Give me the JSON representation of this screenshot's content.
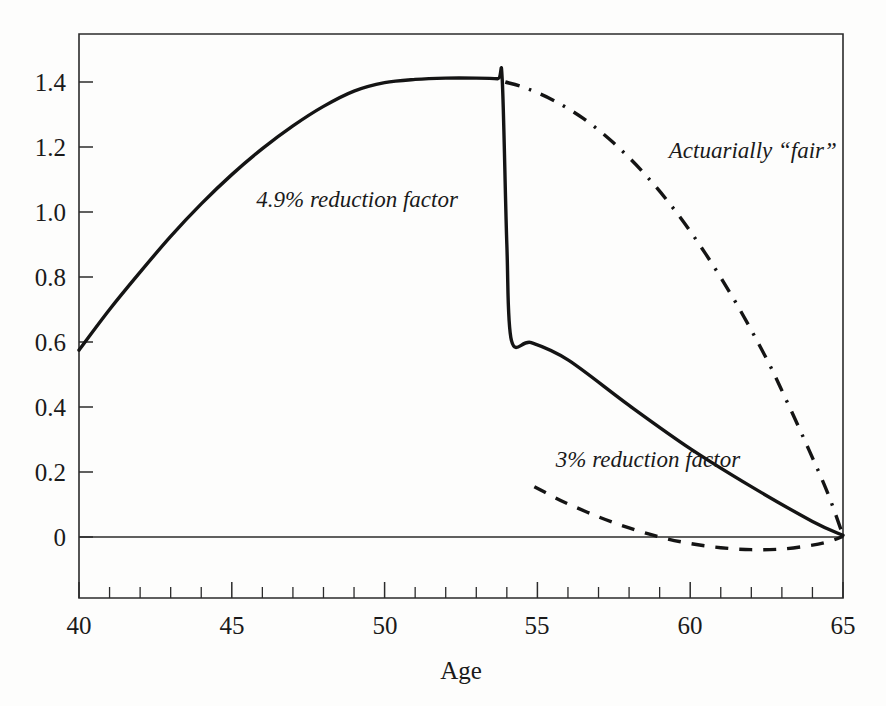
{
  "figure": {
    "background_color": "#fdfdfc",
    "ink_color": "#141414",
    "cropped_caption_fragment": ""
  },
  "chart_data": {
    "type": "line",
    "title": "",
    "xlabel": "Age",
    "ylabel": "",
    "xlim": [
      40,
      65
    ],
    "ylim": [
      -0.08,
      1.52
    ],
    "grid": false,
    "legend_position": "inline-annotations",
    "x_ticks_major": [
      40,
      45,
      50,
      55,
      60,
      65
    ],
    "x_ticks_major_labels": [
      "40",
      "45",
      "50",
      "55",
      "60",
      "65"
    ],
    "x_tick_minor_step": 1,
    "y_ticks_major": [
      0,
      0.2,
      0.4,
      0.6,
      0.8,
      1.0,
      1.2,
      1.4
    ],
    "y_ticks_major_labels": [
      "0",
      "0.2",
      "0.4",
      "0.6",
      "0.8",
      "1.0",
      "1.2",
      "1.4"
    ],
    "zero_reference_line": 0,
    "annotations": [
      {
        "id": "ann-49-reduction",
        "text": "4.9% reduction factor",
        "x": 45.8,
        "y": 1.015,
        "style": "italic"
      },
      {
        "id": "ann-actuarially-fair",
        "text": "Actuarially “fair”",
        "x": 59.3,
        "y": 1.165,
        "style": "italic"
      },
      {
        "id": "ann-3-reduction",
        "text": "3% reduction factor",
        "x": 55.6,
        "y": 0.215,
        "style": "italic"
      }
    ],
    "series": [
      {
        "name": "4.9% reduction factor",
        "style": "solid",
        "label_ref": "ann-49-reduction",
        "note": "Rises from age 40 to a peak near age 53.7, then drops discontinuously at age 54 and declines linearly to zero at 65.",
        "points": [
          [
            40,
            0.575
          ],
          [
            41,
            0.7
          ],
          [
            42,
            0.815
          ],
          [
            43,
            0.925
          ],
          [
            44,
            1.025
          ],
          [
            45,
            1.115
          ],
          [
            46,
            1.195
          ],
          [
            47,
            1.265
          ],
          [
            48,
            1.325
          ],
          [
            49,
            1.372
          ],
          [
            50,
            1.398
          ],
          [
            51,
            1.408
          ],
          [
            52,
            1.412
          ],
          [
            53,
            1.412
          ],
          [
            53.7,
            1.41
          ],
          [
            53.85,
            1.405
          ],
          [
            54.0,
            0.9
          ],
          [
            54.15,
            0.605
          ],
          [
            54.8,
            0.598
          ],
          [
            56,
            0.545
          ],
          [
            58,
            0.405
          ],
          [
            60,
            0.272
          ],
          [
            62,
            0.155
          ],
          [
            64,
            0.048
          ],
          [
            65,
            0.005
          ]
        ]
      },
      {
        "name": "3% reduction factor",
        "style": "dashed",
        "label_ref": "ann-3-reduction",
        "note": "Begins near age 54.9 at 0.155, falls through zero around age 59, dips slightly negative near age 62, returns to zero at 65.",
        "points": [
          [
            54.9,
            0.155
          ],
          [
            55.5,
            0.125
          ],
          [
            56,
            0.102
          ],
          [
            57,
            0.062
          ],
          [
            58,
            0.028
          ],
          [
            59,
            0.0
          ],
          [
            60,
            -0.02
          ],
          [
            61,
            -0.033
          ],
          [
            62,
            -0.039
          ],
          [
            63,
            -0.037
          ],
          [
            64,
            -0.025
          ],
          [
            64.6,
            -0.012
          ],
          [
            65,
            0.002
          ]
        ]
      },
      {
        "name": "Actuarially “fair”",
        "style": "dash-dot",
        "label_ref": "ann-actuarially-fair",
        "note": "Starts at the solid curve peak near age 53.9 at 1.40 and descends with increasing steepness to zero at age 65.",
        "points": [
          [
            53.95,
            1.4
          ],
          [
            54.6,
            1.382
          ],
          [
            55.5,
            1.345
          ],
          [
            56.5,
            1.288
          ],
          [
            57.5,
            1.212
          ],
          [
            58.5,
            1.118
          ],
          [
            59.5,
            1.005
          ],
          [
            60.5,
            0.872
          ],
          [
            61.5,
            0.72
          ],
          [
            62.5,
            0.548
          ],
          [
            63.2,
            0.41
          ],
          [
            63.9,
            0.265
          ],
          [
            64.5,
            0.135
          ],
          [
            65,
            0.005
          ]
        ]
      }
    ]
  }
}
